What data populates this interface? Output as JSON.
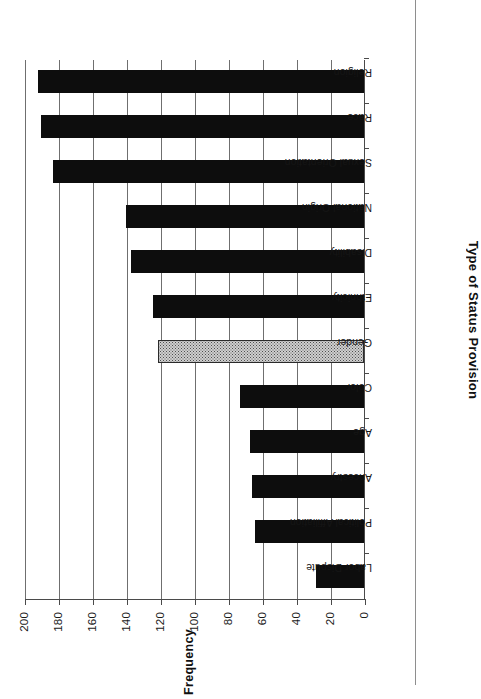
{
  "chart_data": {
    "type": "bar",
    "title": "",
    "xlabel": "Type of Status Provision",
    "ylabel": "Frequency",
    "ylim": [
      0,
      200
    ],
    "ytick_labels": [
      "0",
      "20",
      "40",
      "60",
      "80",
      "100",
      "120",
      "140",
      "160",
      "180",
      "200"
    ],
    "ytick_values": [
      0,
      20,
      40,
      60,
      80,
      100,
      120,
      140,
      160,
      180,
      200
    ],
    "grid": true,
    "legend": "none",
    "orientation": "rotated-90-in-scan",
    "categories": [
      "Labor Dispute",
      "Political Affiliation",
      "Ancestry",
      "Age",
      "Color",
      "Gender",
      "Ethnicity",
      "Disability",
      "National Origin",
      "Sexual Orientation",
      "Race",
      "Religion"
    ],
    "values": [
      28,
      64,
      66,
      67,
      73,
      121,
      124,
      137,
      140,
      183,
      190,
      192
    ],
    "bar_styles": [
      "solid-black",
      "solid-black",
      "solid-black",
      "solid-black",
      "solid-black",
      "dotted-gray",
      "solid-black",
      "solid-black",
      "solid-black",
      "solid-black",
      "solid-black",
      "solid-black"
    ],
    "colors": {
      "bar_solid": "#0d0d0d",
      "bar_pattern_fill": "#cfcfcf",
      "bar_pattern_dots": "#4f4f4f",
      "axis": "#4a4a4a",
      "gridline": "#6f6f6f",
      "text": "#111111",
      "background": "#ffffff"
    }
  }
}
